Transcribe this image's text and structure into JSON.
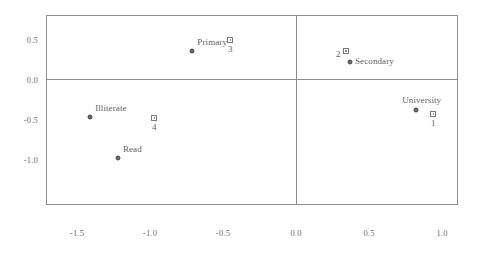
{
  "chart_data": {
    "type": "scatter",
    "title": "",
    "subtitle": "",
    "xlabel": "",
    "ylabel": "",
    "xlim": [
      -1.65,
      1.1
    ],
    "ylim": [
      -1.38,
      0.73
    ],
    "grid": false,
    "legend": "none",
    "zero_lines": {
      "x": 0.0,
      "y": 0.0
    },
    "xticks": [
      -1.5,
      -1.0,
      -0.5,
      0.0,
      0.5,
      1.0
    ],
    "xticklabels": [
      "-1.5",
      "-1.0",
      "-0.5",
      "0.0",
      "0.5",
      "1.0"
    ],
    "yticks": [
      0.5,
      0.0,
      -0.5,
      -1.0
    ],
    "yticklabels": [
      "0.5",
      "0.0",
      "-0.5",
      "-1.0"
    ],
    "series": [
      {
        "name": "row-points",
        "marker": "circle",
        "points": [
          {
            "label": "Illiterate",
            "x": -1.41,
            "y": -0.47,
            "label_pos": "above-right"
          },
          {
            "label": "Read",
            "x": -1.22,
            "y": -0.98,
            "label_pos": "above-right"
          },
          {
            "label": "Primary",
            "x": -0.71,
            "y": 0.36,
            "label_pos": "above-right"
          },
          {
            "label": "Secondary",
            "x": 0.37,
            "y": 0.22,
            "label_pos": "right"
          },
          {
            "label": "University",
            "x": 0.82,
            "y": -0.38,
            "label_pos": "above"
          }
        ]
      },
      {
        "name": "column-points",
        "marker": "square",
        "points": [
          {
            "label": "1",
            "x": 0.94,
            "y": -0.43,
            "label_pos": "below"
          },
          {
            "label": "2",
            "x": 0.34,
            "y": 0.36,
            "label_pos": "left"
          },
          {
            "label": "3",
            "x": -0.45,
            "y": 0.5,
            "label_pos": "below"
          },
          {
            "label": "4",
            "x": -0.97,
            "y": -0.48,
            "label_pos": "below"
          }
        ]
      }
    ]
  },
  "colors": {
    "frame": "#8d8d8d",
    "zero_line": "#8d8d8d",
    "circle_marker": "#666666",
    "square_marker": "#7a7a7a",
    "text": "#5f5f5f",
    "tick_text": "#6d6d6d",
    "background": "#ffffff"
  }
}
